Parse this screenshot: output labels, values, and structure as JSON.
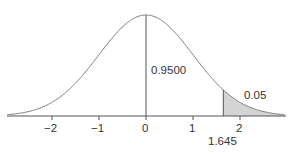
{
  "chart_data": {
    "type": "area",
    "title": "",
    "xlabel": "",
    "ylabel": "",
    "distribution": "standard normal",
    "xlim": [
      -2.95,
      2.95
    ],
    "x_ticks": [
      -2,
      -1,
      0,
      1,
      2
    ],
    "x_tick_labels": [
      "−2",
      "−1",
      "0",
      "1",
      "2"
    ],
    "critical_value": 1.645,
    "critical_value_label": "1.645",
    "shaded_region": {
      "from": 1.645,
      "to": 2.95,
      "area": 0.05,
      "color": "#d4d4d4"
    },
    "annotations": [
      {
        "text": "0.9500",
        "meaning": "area left of 1.645"
      },
      {
        "text": "0.05",
        "meaning": "shaded right-tail area"
      }
    ],
    "grid": false,
    "legend": null
  },
  "labels": {
    "center_area": "0.9500",
    "tail_area": "0.05",
    "critical": "1.645",
    "ticks": [
      "−2",
      "−1",
      "0",
      "1",
      "2"
    ]
  },
  "colors": {
    "curve": "#7a7a7a",
    "axis": "#555555",
    "shade": "#d4d4d4",
    "text": "#333333"
  }
}
